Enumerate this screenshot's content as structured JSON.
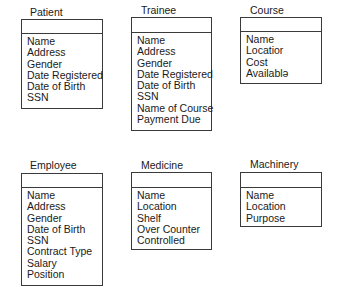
{
  "diagram": {
    "entities": [
      {
        "id": "patient",
        "title": "Patient",
        "attributes": [
          "Name",
          "Address",
          "Gender",
          "Date Registered",
          "Date of Birth",
          "SSN"
        ]
      },
      {
        "id": "trainee",
        "title": "Trainee",
        "attributes": [
          "Name",
          "Address",
          "Gender",
          "Date Registered",
          "Date of Birth",
          "SSN",
          "Name of Course",
          "Payment Due"
        ]
      },
      {
        "id": "course",
        "title": "Course",
        "attributes": [
          "Name",
          "Locatior",
          "Cost",
          "Availablə"
        ]
      },
      {
        "id": "employee",
        "title": "Employee",
        "attributes": [
          "Name",
          "Address",
          "Gender",
          "Date of Birth",
          "SSN",
          "Contract Type",
          "Salary",
          "Position"
        ]
      },
      {
        "id": "medicine",
        "title": "Medicine",
        "attributes": [
          "Name",
          "Location",
          "Shelf",
          "Over Counter",
          "Controlled"
        ]
      },
      {
        "id": "machinery",
        "title": "Machinery",
        "attributes": [
          "Name",
          "Location",
          "Purpose"
        ]
      }
    ]
  }
}
